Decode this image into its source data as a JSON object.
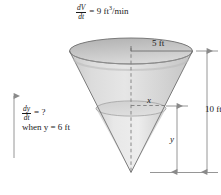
{
  "figure": {
    "title_equation": {
      "numerator": "dV",
      "denominator": "dt",
      "equals": "=",
      "value": "9 ft",
      "exponent": "3",
      "unit": "/min",
      "full": "dV/dt = 9 ft^3/min"
    },
    "question_note": {
      "numerator": "dy",
      "denominator": "dt",
      "equals": "= ?",
      "condition": "when y = 6 ft",
      "full": "dy/dt = ? when y = 6 ft"
    },
    "dimensions": {
      "top_radius": "5 ft",
      "total_height": "10 ft",
      "water_radius": "x",
      "water_height": "y"
    },
    "colors": {
      "cone_fill": "#d4d4d4",
      "cone_fill_light": "#e2e2e2",
      "rim_fill": "#bdbdbd",
      "outline": "#6a6a6a",
      "dimension_line": "#8a8a8a",
      "text": "#1a1a1a"
    },
    "shape": {
      "type": "inverted-cone",
      "description": "Inverted circular cone (funnel) partially filled with liquid"
    }
  }
}
